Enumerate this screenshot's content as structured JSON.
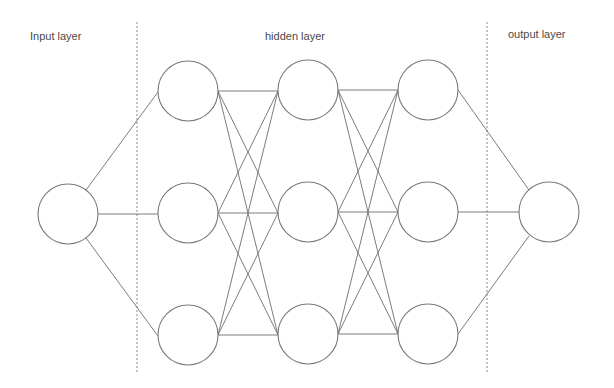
{
  "diagram": {
    "type": "neural-network",
    "labels": {
      "input": "Input layer",
      "hidden": "hidden layer",
      "output": "output layer"
    },
    "layers": [
      {
        "name": "input",
        "node_count": 1
      },
      {
        "name": "hidden-1",
        "node_count": 3
      },
      {
        "name": "hidden-2",
        "node_count": 3
      },
      {
        "name": "hidden-3",
        "node_count": 3
      },
      {
        "name": "output",
        "node_count": 1
      }
    ],
    "connectivity": "fully-connected between adjacent layers",
    "dividers": [
      "input|hidden",
      "hidden|output"
    ],
    "colors": {
      "stroke": "#7a7a7a",
      "text": "#4a4a4a",
      "background": "#ffffff"
    }
  }
}
